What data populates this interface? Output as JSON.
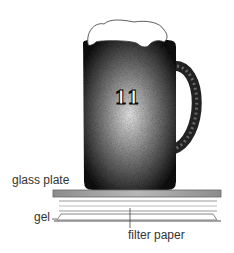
{
  "diagram": {
    "mug_number": "11",
    "labels": {
      "glass_plate": "glass plate",
      "gel": "gel",
      "filter_paper": "filter paper"
    },
    "colors": {
      "mug_dark": "#1a1a1a",
      "plate": "#9a9a9a",
      "lines": "#cccccc"
    }
  }
}
